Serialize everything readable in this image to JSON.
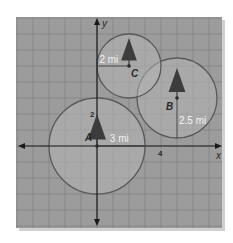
{
  "diagram": {
    "type": "coordinate-plane-circles",
    "colors": {
      "panel": "#9c9c9c",
      "grid": "#848484",
      "axis": "#1a1a1a",
      "circle_stroke": "#5a5a5a",
      "circle_fill": "#b4b4b4",
      "label": "#2a2a2a",
      "radius_label": "#f2f2f2",
      "tree": "#3c3c3c",
      "shadow": "#d0d0d0"
    },
    "axes": {
      "x_label": "x",
      "y_label": "y",
      "x_tick_label": "4",
      "x_tick_value": 4,
      "y_tick_label": "2",
      "y_tick_value": 2
    },
    "grid": {
      "unit_px": 16,
      "x_range": [
        -5,
        8
      ],
      "y_range": [
        -5,
        8
      ]
    },
    "circles": [
      {
        "label": "A",
        "center": [
          0,
          0
        ],
        "radius": 3,
        "radius_text": "3 mi"
      },
      {
        "label": "B",
        "center": [
          5,
          3
        ],
        "radius": 2.5,
        "radius_text": "2.5 mi"
      },
      {
        "label": "C",
        "center": [
          2,
          5
        ],
        "radius": 2,
        "radius_text": "2 mi"
      }
    ]
  }
}
